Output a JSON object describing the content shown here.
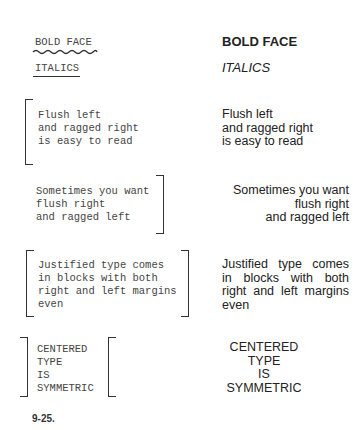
{
  "figure": {
    "caption": "9-25.",
    "left_column_label": "typewritten markup",
    "right_column_label": "typeset result"
  },
  "examples": {
    "bold": {
      "markup": "BOLD FACE",
      "markup_mark": "wavy-underline",
      "result": "BOLD FACE"
    },
    "italics": {
      "markup": "ITALICS",
      "markup_mark": "straight-underline",
      "result": "ITALICS"
    },
    "flush_left": {
      "markup_lines": [
        "Flush left",
        "and ragged right",
        "is easy to read"
      ],
      "result_lines": [
        "Flush left",
        "and ragged right",
        "is easy to read"
      ]
    },
    "flush_right": {
      "markup_lines": [
        "Sometimes you want",
        "flush right",
        "and ragged left"
      ],
      "result_lines": [
        "Sometimes you want",
        "flush right",
        "and ragged left"
      ]
    },
    "justified": {
      "markup_lines": [
        "Justified type comes",
        "in blocks with both",
        "right and left margins",
        "even"
      ],
      "result_lines": [
        "Justified type comes",
        "in blocks with both",
        "right and left margins",
        "even"
      ]
    },
    "centered": {
      "markup_lines": [
        "CENTERED",
        "TYPE",
        "IS",
        "SYMMETRIC"
      ],
      "result_lines": [
        "CENTERED",
        "TYPE",
        "IS",
        "SYMMETRIC"
      ]
    }
  }
}
